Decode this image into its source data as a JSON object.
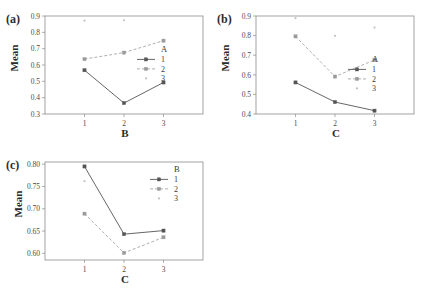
{
  "figure": {
    "panels": [
      {
        "id": "a",
        "label": "(a)",
        "ylabel": "Mean",
        "xlabel": "B",
        "legend_title": "A",
        "chart_data": {
          "type": "line",
          "title": "(a)",
          "xlabel": "B",
          "ylabel": "Mean",
          "categories": [
            "1",
            "2",
            "3"
          ],
          "x_ticks": [
            "1",
            "2",
            "3"
          ],
          "y_ticks": [
            "0.3",
            "0.4",
            "0.5",
            "0.6",
            "0.7",
            "0.8",
            "0.9"
          ],
          "ylim": [
            0.3,
            0.9
          ],
          "grid": false,
          "legend_position": "center-right",
          "series": [
            {
              "name": "1",
              "style": "solid",
              "marker": "square",
              "values": [
                0.568,
                0.367,
                0.493
              ]
            },
            {
              "name": "2",
              "style": "dashed",
              "marker": "square",
              "values": [
                0.636,
                0.676,
                0.749
              ]
            },
            {
              "name": "3",
              "style": "dotted",
              "marker": "dot",
              "values": [
                0.872,
                0.874,
                null
              ]
            }
          ]
        }
      },
      {
        "id": "b",
        "label": "(b)",
        "ylabel": "Mean",
        "xlabel": "C",
        "legend_title": "A",
        "chart_data": {
          "type": "line",
          "title": "(b)",
          "xlabel": "C",
          "ylabel": "Mean",
          "categories": [
            "1",
            "2",
            "3"
          ],
          "x_ticks": [
            "1",
            "2",
            "3"
          ],
          "y_ticks": [
            "0.4",
            "0.5",
            "0.6",
            "0.7",
            "0.8",
            "0.9"
          ],
          "ylim": [
            0.4,
            0.9
          ],
          "grid": false,
          "legend_position": "center-right",
          "series": [
            {
              "name": "1",
              "style": "solid",
              "marker": "square",
              "values": [
                0.561,
                0.461,
                0.417
              ]
            },
            {
              "name": "2",
              "style": "dashed",
              "marker": "square",
              "values": [
                0.796,
                0.591,
                0.676
              ]
            },
            {
              "name": "3",
              "style": "dotted",
              "marker": "dot",
              "values": [
                0.889,
                0.799,
                0.841
              ]
            }
          ]
        }
      },
      {
        "id": "c",
        "label": "(c)",
        "ylabel": "Mean",
        "xlabel": "C",
        "legend_title": "B",
        "chart_data": {
          "type": "line",
          "title": "(c)",
          "xlabel": "C",
          "ylabel": "Mean",
          "categories": [
            "1",
            "2",
            "3"
          ],
          "x_ticks": [
            "1",
            "2",
            "3"
          ],
          "y_ticks": [
            "0.60",
            "0.65",
            "0.70",
            "0.75",
            "0.80"
          ],
          "ylim": [
            0.585,
            0.805
          ],
          "grid": false,
          "legend_position": "top-right",
          "series": [
            {
              "name": "1",
              "style": "solid",
              "marker": "square",
              "values": [
                0.795,
                0.643,
                0.651
              ]
            },
            {
              "name": "2",
              "style": "dashed",
              "marker": "square",
              "values": [
                0.689,
                0.601,
                0.636
              ]
            },
            {
              "name": "3",
              "style": "dotted",
              "marker": "dot",
              "values": [
                0.762,
                null,
                null
              ]
            }
          ]
        }
      }
    ],
    "colors": {
      "series_1": "#555555",
      "series_2": "#9a9a9a",
      "series_3": "#c2c2c2",
      "axis": "#8c8c8c",
      "text": "#333333",
      "background": "#ffffff"
    }
  }
}
